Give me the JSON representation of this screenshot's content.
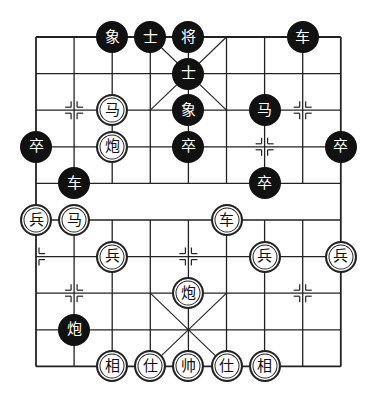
{
  "board": {
    "title": "Xiangqi position",
    "colors": {
      "line": "#222222",
      "black_piece": "#111111",
      "red_piece_fill": "#ffffff",
      "background": "#ffffff"
    },
    "grid": {
      "cols": 9,
      "rows": 10,
      "x0": 36,
      "y0": 37,
      "dx": 38.1,
      "dy": 36.6
    },
    "pieces": [
      {
        "side": "black",
        "char": "象",
        "name": "elephant",
        "col": 2,
        "row": 0
      },
      {
        "side": "black",
        "char": "士",
        "name": "advisor",
        "col": 3,
        "row": 0
      },
      {
        "side": "black",
        "char": "将",
        "name": "general",
        "col": 4,
        "row": 0
      },
      {
        "side": "black",
        "char": "车",
        "name": "chariot",
        "col": 7,
        "row": 0
      },
      {
        "side": "black",
        "char": "士",
        "name": "advisor",
        "col": 4,
        "row": 1
      },
      {
        "side": "red",
        "char": "马",
        "name": "horse",
        "col": 2,
        "row": 2
      },
      {
        "side": "black",
        "char": "象",
        "name": "elephant",
        "col": 4,
        "row": 2
      },
      {
        "side": "black",
        "char": "马",
        "name": "horse",
        "col": 6,
        "row": 2
      },
      {
        "side": "black",
        "char": "卒",
        "name": "soldier",
        "col": 0,
        "row": 3
      },
      {
        "side": "red",
        "char": "炮",
        "name": "cannon",
        "col": 2,
        "row": 3
      },
      {
        "side": "black",
        "char": "卒",
        "name": "soldier",
        "col": 4,
        "row": 3
      },
      {
        "side": "black",
        "char": "卒",
        "name": "soldier",
        "col": 8,
        "row": 3
      },
      {
        "side": "black",
        "char": "车",
        "name": "chariot",
        "col": 1,
        "row": 4
      },
      {
        "side": "black",
        "char": "卒",
        "name": "soldier",
        "col": 6,
        "row": 4
      },
      {
        "side": "red",
        "char": "兵",
        "name": "soldier",
        "col": 0,
        "row": 5
      },
      {
        "side": "red",
        "char": "马",
        "name": "horse",
        "col": 1,
        "row": 5
      },
      {
        "side": "red",
        "char": "车",
        "name": "chariot",
        "col": 5,
        "row": 5
      },
      {
        "side": "red",
        "char": "兵",
        "name": "soldier",
        "col": 2,
        "row": 6
      },
      {
        "side": "red",
        "char": "兵",
        "name": "soldier",
        "col": 6,
        "row": 6
      },
      {
        "side": "red",
        "char": "兵",
        "name": "soldier",
        "col": 8,
        "row": 6
      },
      {
        "side": "red",
        "char": "炮",
        "name": "cannon",
        "col": 4,
        "row": 7
      },
      {
        "side": "black",
        "char": "炮",
        "name": "cannon",
        "col": 1,
        "row": 8
      },
      {
        "side": "red",
        "char": "相",
        "name": "elephant",
        "col": 2,
        "row": 9
      },
      {
        "side": "red",
        "char": "仕",
        "name": "advisor",
        "col": 3,
        "row": 9
      },
      {
        "side": "red",
        "char": "帅",
        "name": "general",
        "col": 4,
        "row": 9
      },
      {
        "side": "red",
        "char": "仕",
        "name": "advisor",
        "col": 5,
        "row": 9
      },
      {
        "side": "red",
        "char": "相",
        "name": "elephant",
        "col": 6,
        "row": 9
      }
    ],
    "markers": [
      {
        "col": 1,
        "row": 2
      },
      {
        "col": 7,
        "row": 2
      },
      {
        "col": 6,
        "row": 3
      },
      {
        "col": 4,
        "row": 6
      },
      {
        "col": 0,
        "row": 6,
        "half": "right"
      },
      {
        "col": 1,
        "row": 7
      },
      {
        "col": 7,
        "row": 7
      }
    ]
  }
}
